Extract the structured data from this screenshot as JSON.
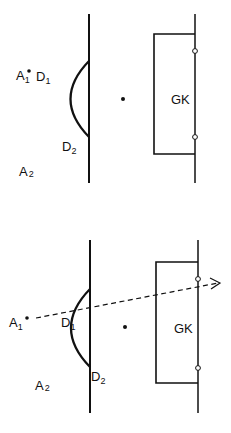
{
  "diagrams": [
    {
      "id": "top",
      "labels": {
        "attacker1": "A",
        "attacker1_sub": "1",
        "defender1": "D",
        "defender1_sub": "1",
        "defender2": "D",
        "defender2_sub": "2",
        "attacker2": "A",
        "attacker2_sub": "2",
        "goalkeeper": "GK"
      }
    },
    {
      "id": "bottom",
      "labels": {
        "attacker1": "A",
        "attacker1_sub": "1",
        "defender1": "D",
        "defender1_sub": "1",
        "defender2": "D",
        "defender2_sub": "2",
        "attacker2": "A",
        "attacker2_sub": "2",
        "goalkeeper": "GK"
      },
      "pass_arrow": "dashed"
    }
  ],
  "colors": {
    "ink": "#111111",
    "background": "#ffffff"
  }
}
